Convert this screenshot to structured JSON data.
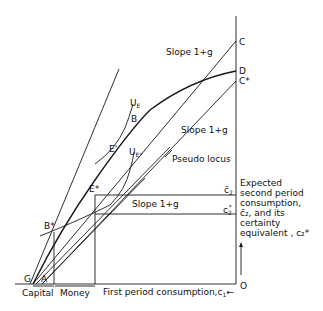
{
  "diagram": {
    "points": {
      "C": "C",
      "D": "D",
      "C_star": "C*",
      "B": "B",
      "E_prime": "E'",
      "E_star": "E*",
      "B_star": "B*",
      "G": "G",
      "A": "A",
      "O": "O"
    },
    "curves": {
      "U_E": "U",
      "U_E_sub": "E",
      "U_Estar": "U",
      "U_Estar_sub": "E*"
    },
    "labels": {
      "slope_top": "Slope 1+g",
      "slope_mid": "Slope 1+g",
      "slope_low": "Slope 1+g",
      "pseudo_locus": "Pseudo locus",
      "c2_bar": "c̄",
      "c2_bar_sub": "2",
      "c2_star": "c",
      "c2_star_sub": "2",
      "c2_star_sup": "*"
    },
    "axes": {
      "y_axis_label_lines": [
        "Expected",
        "second period",
        "consumption,",
        "c̄₂, and its",
        "certainty",
        "equivalent , c₂*"
      ],
      "x_axis_label": "First period consumption,c",
      "x_axis_label_sub": "1",
      "x_arrow": "←",
      "capital_label": "Capital",
      "money_label": "Money"
    }
  }
}
